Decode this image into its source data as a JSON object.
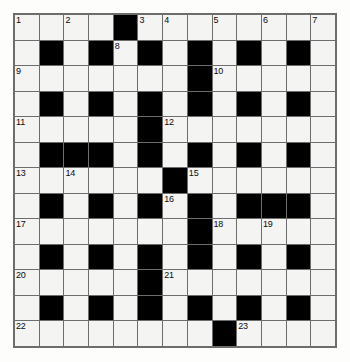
{
  "puzzle": {
    "type": "crossword-grid",
    "rows": 13,
    "columns": 13,
    "colors": {
      "block": "#000000",
      "cell": "#f4f4f2",
      "grid_line": "#6d6d6d",
      "number": "#0b0b0b",
      "page_background": "#fdfdfc"
    },
    "cells": [
      [
        {
          "block": false,
          "number": "1"
        },
        {
          "block": false,
          "number": ""
        },
        {
          "block": false,
          "number": "2"
        },
        {
          "block": false,
          "number": ""
        },
        {
          "block": true,
          "number": ""
        },
        {
          "block": false,
          "number": "3"
        },
        {
          "block": false,
          "number": "4"
        },
        {
          "block": false,
          "number": ""
        },
        {
          "block": false,
          "number": "5"
        },
        {
          "block": false,
          "number": ""
        },
        {
          "block": false,
          "number": "6"
        },
        {
          "block": false,
          "number": ""
        },
        {
          "block": false,
          "number": "7"
        }
      ],
      [
        {
          "block": false,
          "number": ""
        },
        {
          "block": true,
          "number": ""
        },
        {
          "block": false,
          "number": ""
        },
        {
          "block": true,
          "number": ""
        },
        {
          "block": false,
          "number": "8"
        },
        {
          "block": true,
          "number": ""
        },
        {
          "block": false,
          "number": ""
        },
        {
          "block": true,
          "number": ""
        },
        {
          "block": false,
          "number": ""
        },
        {
          "block": true,
          "number": ""
        },
        {
          "block": false,
          "number": ""
        },
        {
          "block": true,
          "number": ""
        },
        {
          "block": false,
          "number": ""
        }
      ],
      [
        {
          "block": false,
          "number": "9"
        },
        {
          "block": false,
          "number": ""
        },
        {
          "block": false,
          "number": ""
        },
        {
          "block": false,
          "number": ""
        },
        {
          "block": false,
          "number": ""
        },
        {
          "block": false,
          "number": ""
        },
        {
          "block": false,
          "number": ""
        },
        {
          "block": true,
          "number": ""
        },
        {
          "block": false,
          "number": "10"
        },
        {
          "block": false,
          "number": ""
        },
        {
          "block": false,
          "number": ""
        },
        {
          "block": false,
          "number": ""
        },
        {
          "block": false,
          "number": ""
        }
      ],
      [
        {
          "block": false,
          "number": ""
        },
        {
          "block": true,
          "number": ""
        },
        {
          "block": false,
          "number": ""
        },
        {
          "block": true,
          "number": ""
        },
        {
          "block": false,
          "number": ""
        },
        {
          "block": true,
          "number": ""
        },
        {
          "block": false,
          "number": ""
        },
        {
          "block": true,
          "number": ""
        },
        {
          "block": false,
          "number": ""
        },
        {
          "block": true,
          "number": ""
        },
        {
          "block": false,
          "number": ""
        },
        {
          "block": true,
          "number": ""
        },
        {
          "block": false,
          "number": ""
        }
      ],
      [
        {
          "block": false,
          "number": "11"
        },
        {
          "block": false,
          "number": ""
        },
        {
          "block": false,
          "number": ""
        },
        {
          "block": false,
          "number": ""
        },
        {
          "block": false,
          "number": ""
        },
        {
          "block": true,
          "number": ""
        },
        {
          "block": false,
          "number": "12"
        },
        {
          "block": false,
          "number": ""
        },
        {
          "block": false,
          "number": ""
        },
        {
          "block": false,
          "number": ""
        },
        {
          "block": false,
          "number": ""
        },
        {
          "block": false,
          "number": ""
        },
        {
          "block": false,
          "number": ""
        }
      ],
      [
        {
          "block": false,
          "number": ""
        },
        {
          "block": true,
          "number": ""
        },
        {
          "block": true,
          "number": ""
        },
        {
          "block": true,
          "number": ""
        },
        {
          "block": false,
          "number": ""
        },
        {
          "block": true,
          "number": ""
        },
        {
          "block": false,
          "number": ""
        },
        {
          "block": true,
          "number": ""
        },
        {
          "block": false,
          "number": ""
        },
        {
          "block": true,
          "number": ""
        },
        {
          "block": false,
          "number": ""
        },
        {
          "block": true,
          "number": ""
        },
        {
          "block": false,
          "number": ""
        }
      ],
      [
        {
          "block": false,
          "number": "13"
        },
        {
          "block": false,
          "number": ""
        },
        {
          "block": false,
          "number": "14"
        },
        {
          "block": false,
          "number": ""
        },
        {
          "block": false,
          "number": ""
        },
        {
          "block": false,
          "number": ""
        },
        {
          "block": true,
          "number": ""
        },
        {
          "block": false,
          "number": "15"
        },
        {
          "block": false,
          "number": ""
        },
        {
          "block": false,
          "number": ""
        },
        {
          "block": false,
          "number": ""
        },
        {
          "block": false,
          "number": ""
        },
        {
          "block": false,
          "number": ""
        }
      ],
      [
        {
          "block": false,
          "number": ""
        },
        {
          "block": true,
          "number": ""
        },
        {
          "block": false,
          "number": ""
        },
        {
          "block": true,
          "number": ""
        },
        {
          "block": false,
          "number": ""
        },
        {
          "block": true,
          "number": ""
        },
        {
          "block": false,
          "number": "16"
        },
        {
          "block": true,
          "number": ""
        },
        {
          "block": false,
          "number": ""
        },
        {
          "block": true,
          "number": ""
        },
        {
          "block": true,
          "number": ""
        },
        {
          "block": true,
          "number": ""
        },
        {
          "block": false,
          "number": ""
        }
      ],
      [
        {
          "block": false,
          "number": "17"
        },
        {
          "block": false,
          "number": ""
        },
        {
          "block": false,
          "number": ""
        },
        {
          "block": false,
          "number": ""
        },
        {
          "block": false,
          "number": ""
        },
        {
          "block": false,
          "number": ""
        },
        {
          "block": false,
          "number": ""
        },
        {
          "block": true,
          "number": ""
        },
        {
          "block": false,
          "number": "18"
        },
        {
          "block": false,
          "number": ""
        },
        {
          "block": false,
          "number": "19"
        },
        {
          "block": false,
          "number": ""
        },
        {
          "block": false,
          "number": ""
        }
      ],
      [
        {
          "block": false,
          "number": ""
        },
        {
          "block": true,
          "number": ""
        },
        {
          "block": false,
          "number": ""
        },
        {
          "block": true,
          "number": ""
        },
        {
          "block": false,
          "number": ""
        },
        {
          "block": true,
          "number": ""
        },
        {
          "block": false,
          "number": ""
        },
        {
          "block": true,
          "number": ""
        },
        {
          "block": false,
          "number": ""
        },
        {
          "block": true,
          "number": ""
        },
        {
          "block": false,
          "number": ""
        },
        {
          "block": true,
          "number": ""
        },
        {
          "block": false,
          "number": ""
        }
      ],
      [
        {
          "block": false,
          "number": "20"
        },
        {
          "block": false,
          "number": ""
        },
        {
          "block": false,
          "number": ""
        },
        {
          "block": false,
          "number": ""
        },
        {
          "block": false,
          "number": ""
        },
        {
          "block": true,
          "number": ""
        },
        {
          "block": false,
          "number": "21"
        },
        {
          "block": false,
          "number": ""
        },
        {
          "block": false,
          "number": ""
        },
        {
          "block": false,
          "number": ""
        },
        {
          "block": false,
          "number": ""
        },
        {
          "block": false,
          "number": ""
        },
        {
          "block": false,
          "number": ""
        }
      ],
      [
        {
          "block": false,
          "number": ""
        },
        {
          "block": true,
          "number": ""
        },
        {
          "block": false,
          "number": ""
        },
        {
          "block": true,
          "number": ""
        },
        {
          "block": false,
          "number": ""
        },
        {
          "block": true,
          "number": ""
        },
        {
          "block": false,
          "number": ""
        },
        {
          "block": true,
          "number": ""
        },
        {
          "block": false,
          "number": ""
        },
        {
          "block": true,
          "number": ""
        },
        {
          "block": false,
          "number": ""
        },
        {
          "block": true,
          "number": ""
        },
        {
          "block": false,
          "number": ""
        }
      ],
      [
        {
          "block": false,
          "number": "22"
        },
        {
          "block": false,
          "number": ""
        },
        {
          "block": false,
          "number": ""
        },
        {
          "block": false,
          "number": ""
        },
        {
          "block": false,
          "number": ""
        },
        {
          "block": false,
          "number": ""
        },
        {
          "block": false,
          "number": ""
        },
        {
          "block": false,
          "number": ""
        },
        {
          "block": true,
          "number": ""
        },
        {
          "block": false,
          "number": "23"
        },
        {
          "block": false,
          "number": ""
        },
        {
          "block": false,
          "number": ""
        },
        {
          "block": false,
          "number": ""
        }
      ]
    ],
    "clue_numbers": [
      "1",
      "2",
      "3",
      "4",
      "5",
      "6",
      "7",
      "8",
      "9",
      "10",
      "11",
      "12",
      "13",
      "14",
      "15",
      "16",
      "17",
      "18",
      "19",
      "20",
      "21",
      "22",
      "23"
    ]
  }
}
